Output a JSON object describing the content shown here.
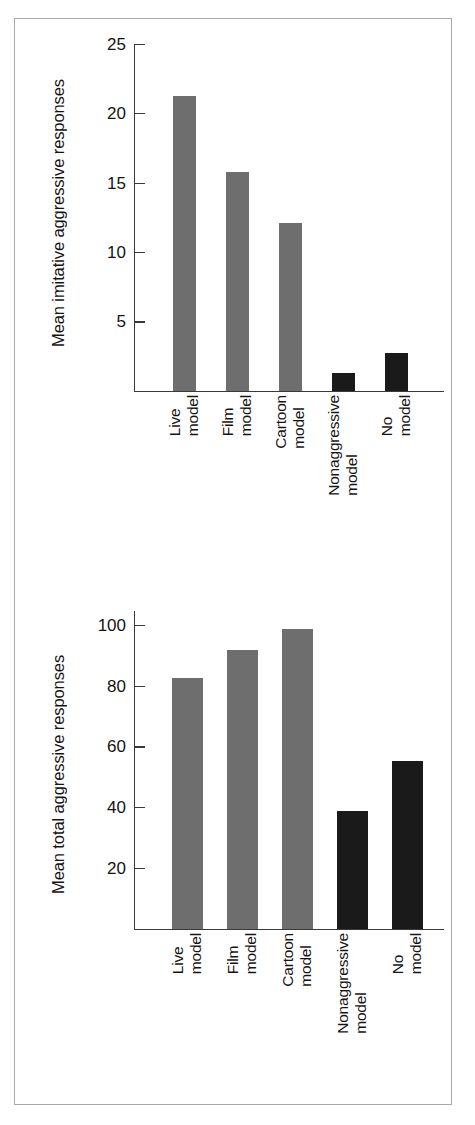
{
  "figure": {
    "border_color": "#a8a8a8",
    "background": "#ffffff"
  },
  "palette": {
    "aggressive_model_bar": "#6e6e6e",
    "control_bar": "#1a1a1a",
    "axis": "#3a3a3a",
    "text": "#141414"
  },
  "chart_data": [
    {
      "type": "bar",
      "title": "",
      "xlabel": "",
      "ylabel": "Mean imitative aggressive responses",
      "ylim": [
        0,
        25
      ],
      "yticks": [
        5,
        10,
        15,
        20,
        25
      ],
      "ytick_labels": [
        "5",
        "10",
        "15",
        "20",
        "25"
      ],
      "grid": false,
      "legend": "none",
      "categories": [
        "Live model",
        "Film model",
        "Cartoon model",
        "Nonaggressive model",
        "No model"
      ],
      "category_lines": [
        [
          "Live",
          "model"
        ],
        [
          "Film",
          "model"
        ],
        [
          "Cartoon",
          "model"
        ],
        [
          "Nonaggressive",
          "model"
        ],
        [
          "No",
          "model"
        ]
      ],
      "values": [
        21.3,
        15.8,
        12.1,
        1.3,
        2.7
      ],
      "bar_colors": [
        "#6e6e6e",
        "#6e6e6e",
        "#6e6e6e",
        "#1a1a1a",
        "#1a1a1a"
      ]
    },
    {
      "type": "bar",
      "title": "",
      "xlabel": "",
      "ylabel": "Mean total aggressive responses",
      "ylim": [
        0,
        105
      ],
      "yticks": [
        20,
        40,
        60,
        80,
        100
      ],
      "ytick_labels": [
        "20",
        "40",
        "60",
        "80",
        "100"
      ],
      "grid": false,
      "legend": "none",
      "categories": [
        "Live model",
        "Film model",
        "Cartoon model",
        "Nonaggressive model",
        "No model"
      ],
      "category_lines": [
        [
          "Live",
          "model"
        ],
        [
          "Film",
          "model"
        ],
        [
          "Cartoon",
          "model"
        ],
        [
          "Nonaggressive",
          "model"
        ],
        [
          "No",
          "model"
        ]
      ],
      "values": [
        83,
        92,
        99,
        39,
        55.5
      ],
      "bar_colors": [
        "#6e6e6e",
        "#6e6e6e",
        "#6e6e6e",
        "#1a1a1a",
        "#1a1a1a"
      ]
    }
  ]
}
